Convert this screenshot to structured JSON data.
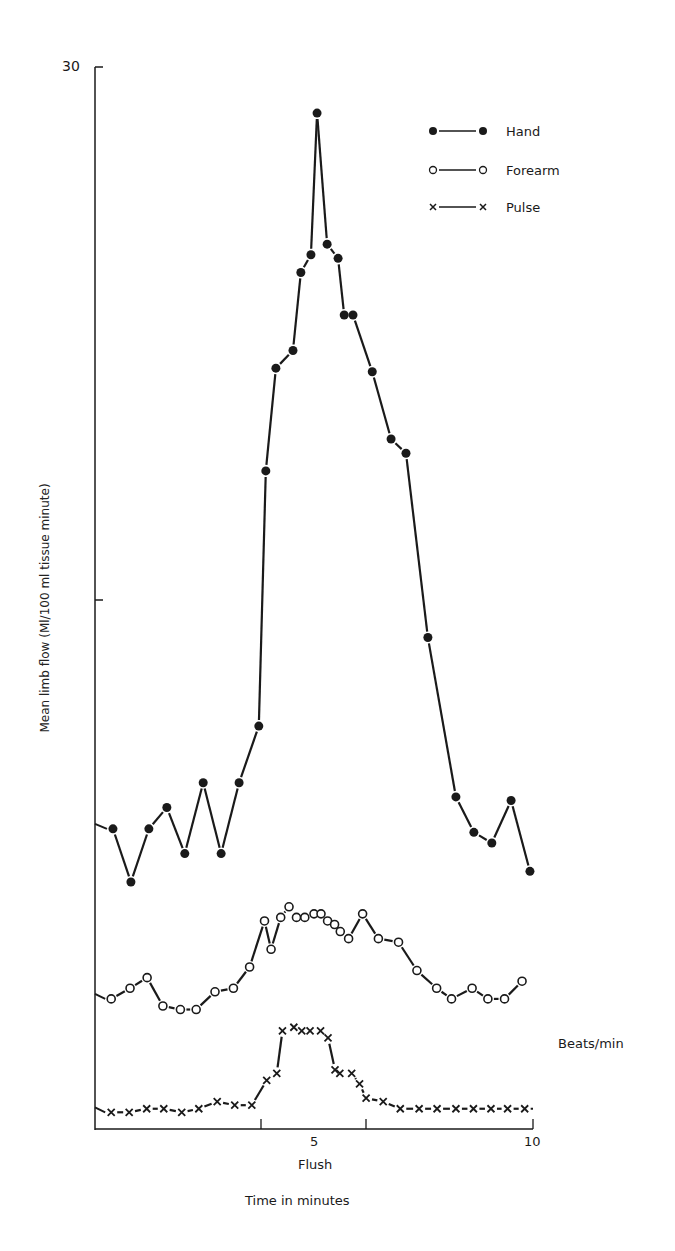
{
  "chart_data": {
    "type": "line",
    "title": "",
    "xlabel": "Time in minutes",
    "ylabel": "Mean limb flow (Ml/100 ml tissue minute)",
    "secondary_ylabel": "Beats/min",
    "x_annotation": "Flush",
    "x_ticks": [
      5,
      10
    ],
    "x_tick_labels": [
      "5",
      "10"
    ],
    "flush_interval": [
      3.8,
      6.2
    ],
    "y_ticks": [
      15,
      30
    ],
    "y_tick_labels": [
      "",
      "30"
    ],
    "xlim": [
      0,
      10
    ],
    "ylim": [
      0,
      30
    ],
    "grid": false,
    "legend_position": "top-right",
    "series": [
      {
        "name": "Hand",
        "marker": "filled-circle",
        "x": [
          0.41,
          0.82,
          1.23,
          1.64,
          2.05,
          2.47,
          2.88,
          3.29,
          3.74,
          3.9,
          4.13,
          4.52,
          4.7,
          4.93,
          5.07,
          5.3,
          5.55,
          5.69,
          5.89,
          6.33,
          6.76,
          7.1,
          7.6,
          8.24,
          8.65,
          9.06,
          9.5,
          9.93
        ],
        "values": [
          8.5,
          7.0,
          8.5,
          9.1,
          7.8,
          9.8,
          7.8,
          9.8,
          11.4,
          18.6,
          21.5,
          22.0,
          24.2,
          24.7,
          28.7,
          25.0,
          24.6,
          23.0,
          23.0,
          21.4,
          19.5,
          19.1,
          13.9,
          9.4,
          8.4,
          8.1,
          9.3,
          7.3
        ]
      },
      {
        "name": "Forearm",
        "marker": "open-circle",
        "x": [
          0.37,
          0.8,
          1.19,
          1.55,
          1.95,
          2.31,
          2.74,
          3.16,
          3.53,
          3.87,
          4.02,
          4.24,
          4.43,
          4.6,
          4.79,
          5.0,
          5.16,
          5.31,
          5.47,
          5.6,
          5.79,
          6.11,
          6.47,
          6.93,
          7.35,
          7.8,
          8.14,
          8.61,
          8.97,
          9.35,
          9.75
        ],
        "values": [
          3.7,
          4.0,
          4.3,
          3.5,
          3.4,
          3.4,
          3.9,
          4.0,
          4.6,
          5.9,
          5.1,
          6.0,
          6.3,
          6.0,
          6.0,
          6.1,
          6.1,
          5.9,
          5.8,
          5.6,
          5.4,
          6.1,
          5.4,
          5.3,
          4.5,
          4.0,
          3.7,
          4.0,
          3.7,
          3.7,
          4.2
        ]
      },
      {
        "name": "Pulse",
        "marker": "x",
        "x": [
          0.37,
          0.78,
          1.18,
          1.57,
          1.98,
          2.37,
          2.79,
          3.19,
          3.58,
          3.92,
          4.15,
          4.28,
          4.54,
          4.72,
          4.91,
          5.15,
          5.32,
          5.48,
          5.59,
          5.86,
          6.04,
          6.19,
          6.58,
          6.97,
          7.4,
          7.81,
          8.24,
          8.64,
          9.04,
          9.42,
          9.81
        ],
        "values": [
          0.5,
          0.5,
          0.6,
          0.6,
          0.5,
          0.6,
          0.8,
          0.7,
          0.7,
          1.4,
          1.6,
          2.8,
          2.9,
          2.8,
          2.8,
          2.8,
          2.6,
          1.7,
          1.6,
          1.6,
          1.3,
          0.9,
          0.8,
          0.6,
          0.6,
          0.6,
          0.6,
          0.6,
          0.6,
          0.6,
          0.6
        ]
      }
    ]
  },
  "labels": {
    "y_top_tick": "30",
    "x_tick_5": "5",
    "x_tick_10": "10",
    "flush": "Flush",
    "xlabel": "Time in minutes",
    "ylabel": "Mean limb flow (Ml/100 ml tissue minute)",
    "beats": "Beats/min"
  },
  "legend": [
    {
      "label": "Hand",
      "marker": "filled-circle"
    },
    {
      "label": "Forearm",
      "marker": "open-circle"
    },
    {
      "label": "Pulse",
      "marker": "x"
    }
  ],
  "colors": {
    "ink": "#1a1a1a",
    "background": "#ffffff"
  }
}
